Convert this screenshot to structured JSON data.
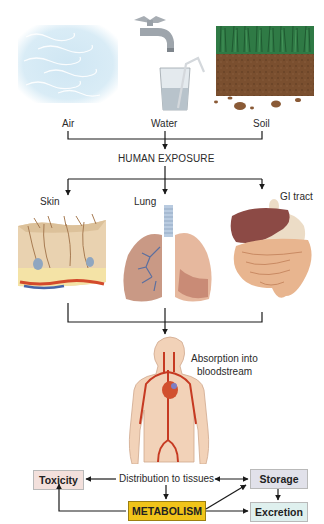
{
  "sources": {
    "air": {
      "label": "Air",
      "icon": "air-wind-icon"
    },
    "water": {
      "label": "Water",
      "icon": "faucet-glass-icon"
    },
    "soil": {
      "label": "Soil",
      "icon": "soil-grass-icon"
    }
  },
  "exposure": {
    "label": "HUMAN EXPOSURE"
  },
  "routes": {
    "skin": {
      "label": "Skin",
      "icon": "skin-cross-section-icon"
    },
    "lung": {
      "label": "Lung",
      "icon": "lungs-icon"
    },
    "gi": {
      "label": "GI tract",
      "icon": "gi-tract-icon"
    }
  },
  "absorption": {
    "line1": "Absorption into",
    "line2": "bloodstream",
    "icon": "human-circulatory-icon"
  },
  "outcomes": {
    "distribution": "Distribution to tissues",
    "toxicity": "Toxicity",
    "storage": "Storage",
    "metabolism": "METABOLISM",
    "excretion": "Excretion"
  },
  "colors": {
    "toxicity_box": "#f3e0dc",
    "storage_box": "#e1e1ea",
    "excretion_box": "#dff0ee",
    "metabolism_box": "#f0c419",
    "lines": "#1a1a1a"
  }
}
